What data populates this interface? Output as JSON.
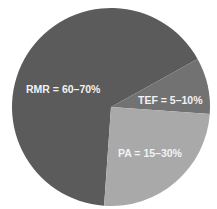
{
  "chart_data": {
    "type": "pie",
    "title": "",
    "slices": [
      {
        "label": "RMR = 60–70%",
        "name": "RMR",
        "range": "60–70%",
        "value": 65,
        "color": "#5b5b5b"
      },
      {
        "label": "TEF = 5–10%",
        "name": "TEF",
        "range": "5–10%",
        "value": 9,
        "color": "#727272"
      },
      {
        "label": "PA = 15–30%",
        "name": "PA",
        "range": "15–30%",
        "value": 25,
        "color": "#a9a9a9"
      }
    ],
    "legend": "none (labels inside slices)"
  }
}
